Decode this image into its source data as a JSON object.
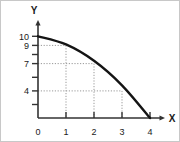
{
  "chart_data": {
    "type": "line",
    "title": "",
    "subtitle": "",
    "xlabel": "X",
    "ylabel": "Y",
    "xlim": [
      0,
      4.35
    ],
    "ylim": [
      0,
      11.2
    ],
    "grid": true,
    "grid_style": "dotted-step",
    "legend": null,
    "x_ticks": [
      0,
      1,
      2,
      3,
      4
    ],
    "x_tick_labels": [
      "0",
      "1",
      "2",
      "3",
      "4"
    ],
    "y_ticks": [
      1,
      2,
      4,
      5.5,
      7,
      8,
      9,
      10
    ],
    "y_tick_labels": [
      "",
      "",
      "4",
      "",
      "7",
      "",
      "9",
      "10"
    ],
    "y_labeled_ticks": [
      4,
      7,
      9,
      10
    ],
    "y_labeled_tick_labels": [
      "4",
      "7",
      "9",
      "10"
    ],
    "series": [
      {
        "name": "curve",
        "color": "#141414",
        "x": [
          0,
          1,
          2,
          3,
          4
        ],
        "values": [
          10,
          9,
          7,
          4,
          0
        ]
      }
    ],
    "annotations": []
  },
  "axes": {
    "y_title": "Y",
    "x_title": "X",
    "y_arrow": "arrow-up",
    "x_arrow": "arrow-right"
  },
  "colors": {
    "curve": "#141414",
    "axis": "#333333",
    "grid": "#999999",
    "frame": "#c8c8c8",
    "text": "#1a1a1a",
    "background": "#ffffff"
  }
}
